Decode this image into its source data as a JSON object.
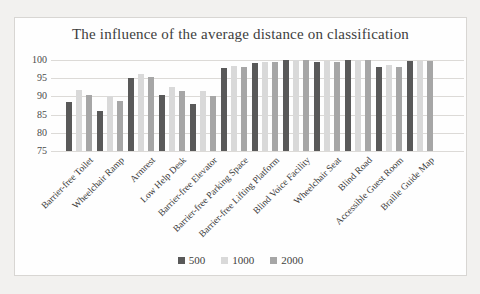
{
  "chart_data": {
    "type": "bar",
    "title": "The influence of the average distance on classification",
    "categories": [
      "Barrier-free Toilet",
      "Wheelchair Ramp",
      "Armrest",
      "Low Help Desk",
      "Barrier-free Elevator",
      "Barrier-free Parking Space",
      "Barrier-free Lifting Platform",
      "Blind Voice Facility",
      "Wheelchair Seat",
      "Blind Road",
      "Accessible Guest Room",
      "Braille Guide Map"
    ],
    "series": [
      {
        "name": "500",
        "color": "#595959",
        "values": [
          88.5,
          86.0,
          95.0,
          90.3,
          88.0,
          97.8,
          99.3,
          100,
          99.5,
          100,
          98.0,
          99.6
        ]
      },
      {
        "name": "1000",
        "color": "#d9d9d9",
        "values": [
          91.7,
          90.0,
          96.2,
          92.5,
          91.5,
          98.3,
          99.5,
          100,
          99.6,
          100,
          98.5,
          99.7
        ]
      },
      {
        "name": "2000",
        "color": "#a6a6a6",
        "values": [
          90.5,
          88.8,
          95.3,
          91.5,
          90.0,
          98.0,
          99.4,
          100,
          99.5,
          100,
          98.2,
          99.6
        ]
      }
    ],
    "ylim": [
      75,
      100
    ],
    "yticks": [
      75,
      80,
      85,
      90,
      95,
      100
    ],
    "grid": "horizontal",
    "legend_position": "bottom",
    "colors": {
      "title_text": "#3d3d3d",
      "axis_text": "#4a4a4a",
      "gridline": "#dcdad7",
      "frame_border": "#d8d6d3",
      "frame_background": "#fefefe",
      "page_background": "#f2f1ef"
    }
  }
}
